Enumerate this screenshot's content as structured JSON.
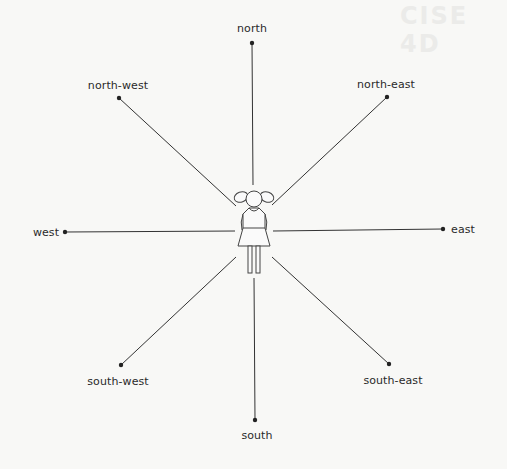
{
  "diagram": {
    "background_ghost_text": "CISE 4D",
    "center_figure": "girl",
    "line_color": "#333333",
    "directions": [
      {
        "key": "north",
        "label": "north"
      },
      {
        "key": "north-east",
        "label": "north-east"
      },
      {
        "key": "east",
        "label": "east"
      },
      {
        "key": "south-east",
        "label": "south-east"
      },
      {
        "key": "south",
        "label": "south"
      },
      {
        "key": "south-west",
        "label": "south-west"
      },
      {
        "key": "west",
        "label": "west"
      },
      {
        "key": "north-west",
        "label": "north-west"
      }
    ]
  }
}
